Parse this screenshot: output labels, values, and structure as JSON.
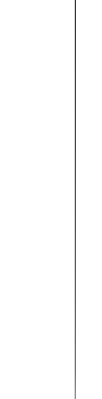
{
  "canvas": {
    "width": 102,
    "height": 399,
    "background_color": "#ffffff"
  },
  "divider": {
    "name": "vertical-divider-rule",
    "orientation": "vertical",
    "x_position": 75,
    "top": 0,
    "length": 399,
    "thickness": 1,
    "color_top": "#2d2f31",
    "color_bottom": "#8d9194",
    "label": ""
  },
  "panes": {
    "left": {
      "label": "",
      "background_color": "#ffffff"
    },
    "right": {
      "label": "",
      "background_color": "#ffffff"
    }
  }
}
